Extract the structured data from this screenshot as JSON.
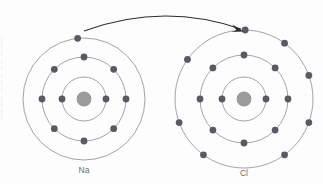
{
  "figure": {
    "width": 323,
    "height": 184,
    "background_color": "#fdfdfd",
    "shell_color": "#9a9a9a",
    "electron_color": "#5a5a66",
    "nucleus_color": "#9b9b9b",
    "arrow_color": "#2b2b33",
    "label_color": "#6e6e6e"
  },
  "atoms": [
    {
      "id": "sodium",
      "label": "Na",
      "label_x": 84,
      "label_y": 173,
      "center_x": 84,
      "center_y": 99,
      "nucleus_radius": 7.5,
      "shells": [
        {
          "name": "shell-1",
          "radius": 22,
          "electron_count": 2,
          "angles": [
            180,
            0
          ]
        },
        {
          "name": "shell-2",
          "radius": 42,
          "electron_count": 8,
          "angles": [
            270,
            315,
            0,
            45,
            90,
            135,
            180,
            225
          ]
        },
        {
          "name": "shell-3",
          "radius": 61,
          "electron_count": 1,
          "angles": [
            264
          ]
        }
      ]
    },
    {
      "id": "chlorine",
      "label": "Cl",
      "label_x": 244,
      "label_y": 176,
      "center_x": 244,
      "center_y": 99,
      "nucleus_radius": 7.5,
      "shells": [
        {
          "name": "shell-1",
          "radius": 22,
          "electron_count": 2,
          "angles": [
            180,
            0
          ]
        },
        {
          "name": "shell-2",
          "radius": 44,
          "electron_count": 8,
          "angles": [
            270,
            315,
            0,
            45,
            90,
            135,
            180,
            225
          ]
        },
        {
          "name": "shell-3",
          "radius": 69,
          "electron_count": 8,
          "angles": [
            271,
            306,
            340,
            20,
            54,
            126,
            160,
            215
          ]
        }
      ]
    }
  ],
  "arrow": {
    "name": "electron-transfer-arrow",
    "from_x": 84,
    "from_y": 31,
    "to_x": 241,
    "to_y": 29,
    "control_x": 163,
    "control_y": 2,
    "head_points": "243.5,31.5 232.5,24.5 236.5,30.5 231.0,32.0"
  },
  "electron_radius": 3.4,
  "margin_note": "|\n|\n|\n|\n|\n|\n|\n|\n|\n|\n|\n|"
}
